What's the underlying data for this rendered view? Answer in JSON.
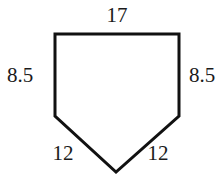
{
  "diagram": {
    "type": "pentagon",
    "stroke_color": "#111111",
    "background": "#ffffff",
    "vertices": [
      [
        55,
        34
      ],
      [
        179,
        34
      ],
      [
        179,
        116
      ],
      [
        116,
        172
      ],
      [
        55,
        116
      ]
    ],
    "sides": {
      "top": "17",
      "left": "8.5",
      "right": "8.5",
      "bottom_left": "12",
      "bottom_right": "12"
    }
  }
}
